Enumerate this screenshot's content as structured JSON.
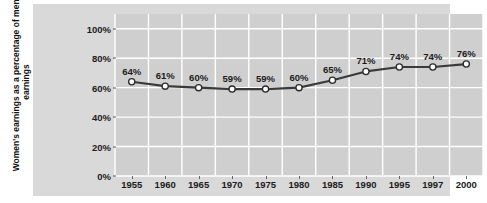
{
  "chart_data": {
    "type": "line",
    "title": "",
    "xlabel": "",
    "ylabel": "Women's earnings as a percentage of men's earnings",
    "categories": [
      "1955",
      "1960",
      "1965",
      "1970",
      "1975",
      "1980",
      "1985",
      "1990",
      "1995",
      "1997",
      "2000"
    ],
    "values": [
      64,
      61,
      60,
      59,
      59,
      60,
      65,
      71,
      74,
      74,
      76
    ],
    "point_labels": [
      "64%",
      "61%",
      "60%",
      "59%",
      "59%",
      "60%",
      "65%",
      "71%",
      "74%",
      "74%",
      "76%"
    ],
    "ylim": [
      0,
      110
    ],
    "y_ticks": [
      0,
      20,
      40,
      60,
      80,
      100
    ],
    "y_tick_labels": [
      "0%",
      "20%",
      "40%",
      "60%",
      "80%",
      "100%"
    ],
    "grid": true,
    "legend": "none",
    "colors": {
      "line": "#3a3a3a",
      "marker_fill": "#ffffff",
      "marker_edge": "#2b2b2b",
      "plot_background": "#cfcfcf",
      "panel_background": "#d9d9d9",
      "gridline": "#ffffff",
      "text": "#1c1c1c",
      "page_background": "#ffffff"
    }
  }
}
